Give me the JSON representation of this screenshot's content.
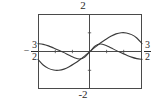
{
  "figure": {
    "name": "graphing-calculator-plot",
    "background_color": "#ffffff",
    "frame_color": "#4a4a4a",
    "axis_color": "#4a4a4a",
    "curve_color": "#3a3a3a"
  },
  "labels": {
    "top": "2",
    "bottom": "-2",
    "left_minus": "−",
    "left_numerator": "3",
    "left_denominator": "2",
    "right_numerator": "3",
    "right_denominator": "2"
  },
  "chart_data": {
    "type": "line",
    "title": "",
    "xlabel": "",
    "ylabel": "",
    "xlim": [
      -1.5,
      1.5
    ],
    "ylim": [
      -2,
      2
    ],
    "grid": false,
    "legend": "none",
    "axes": {
      "x_axis_at_y": 0,
      "y_axis_at_x": 0,
      "x_ticks": [
        -1,
        -0.5,
        0.5,
        1
      ],
      "y_ticks": [
        -1,
        1
      ],
      "x_tick_labels_shown": false,
      "y_tick_labels_shown": false,
      "border_labels": {
        "top": "2",
        "bottom": "-2",
        "left": "-3/2",
        "right": "3/2"
      }
    },
    "series": [
      {
        "name": "large-amplitude-sine",
        "description": "Sine-like curve, negative on x<0, positive on x>0, amplitude about 1",
        "x": [
          -1.5,
          -1.35,
          -1.2,
          -1.05,
          -0.9,
          -0.75,
          -0.6,
          -0.45,
          -0.3,
          -0.15,
          0,
          0.15,
          0.3,
          0.45,
          0.6,
          0.75,
          0.9,
          1.05,
          1.2,
          1.35,
          1.5
        ],
        "y": [
          -0.42,
          -0.72,
          -0.9,
          -0.99,
          -1.0,
          -0.94,
          -0.81,
          -0.64,
          -0.45,
          -0.23,
          0,
          0.23,
          0.45,
          0.64,
          0.81,
          0.94,
          1.0,
          0.99,
          0.9,
          0.72,
          0.42
        ]
      },
      {
        "name": "small-amplitude-sine",
        "description": "Lower-amplitude curve crossing origin, peaks earlier then declines",
        "x": [
          -1.5,
          -1.35,
          -1.2,
          -1.05,
          -0.9,
          -0.75,
          -0.6,
          -0.45,
          -0.3,
          -0.15,
          0,
          0.15,
          0.3,
          0.45,
          0.6,
          0.75,
          0.9,
          1.05,
          1.2,
          1.35,
          1.5
        ],
        "y": [
          0.42,
          0.38,
          0.3,
          0.19,
          0.07,
          -0.06,
          -0.2,
          -0.33,
          -0.4,
          -0.3,
          0,
          0.3,
          0.4,
          0.33,
          0.2,
          0.06,
          -0.07,
          -0.19,
          -0.3,
          -0.38,
          -0.42
        ]
      }
    ]
  }
}
